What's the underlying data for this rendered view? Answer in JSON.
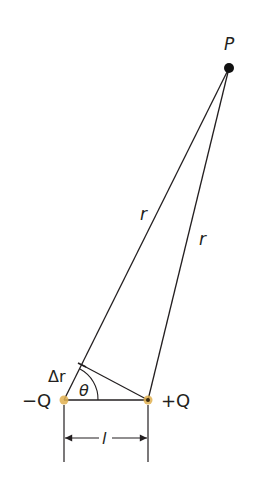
{
  "diagram": {
    "points": {
      "P": {
        "label": "P",
        "x": 229,
        "y": 68
      },
      "minus_charge": {
        "label": "−Q",
        "x": 64,
        "y": 400
      },
      "plus_charge": {
        "label": "+Q",
        "x": 148,
        "y": 400
      },
      "perp_foot": {
        "x": 82,
        "y": 365
      }
    },
    "labels": {
      "point": "P",
      "r_left": "r",
      "r_right": "r",
      "delta_r": "Δr",
      "theta": "θ",
      "minus_q": "−Q",
      "plus_q": "+Q",
      "separation": "l"
    },
    "colors": {
      "line": "#231f20",
      "charge": "#e0b050",
      "point": "#111111",
      "background": "#ffffff"
    }
  }
}
